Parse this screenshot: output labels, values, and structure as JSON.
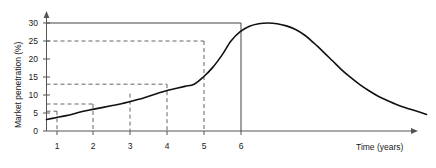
{
  "chart_data": {
    "type": "line",
    "title": "",
    "xlabel": "Time (years)",
    "ylabel": "Market penetration (%)",
    "xlim": [
      0,
      10.6
    ],
    "ylim": [
      0,
      32.5
    ],
    "grid": false,
    "legend": "none",
    "x_ticks": [
      "1",
      "2",
      "3",
      "4",
      "5",
      "6"
    ],
    "x_tick_values": [
      1,
      2,
      3,
      4,
      5,
      6
    ],
    "y_ticks": [
      "0",
      "5",
      "10",
      "15",
      "20",
      "25",
      "30"
    ],
    "y_tick_values": [
      0,
      5,
      10,
      15,
      20,
      25,
      30
    ],
    "series": [
      {
        "name": "Market penetration",
        "x": [
          0.0,
          0.25,
          0.5,
          0.75,
          1.0,
          1.25,
          1.5,
          1.75,
          2.0,
          2.25,
          2.5,
          2.75,
          3.0,
          3.25,
          3.5,
          3.75,
          4.0,
          4.25,
          4.5,
          4.75,
          5.0,
          5.25,
          5.5,
          5.75,
          6.0,
          6.25,
          6.5,
          6.75,
          7.0,
          7.25,
          7.5,
          7.75,
          8.0,
          8.25,
          8.5,
          8.75,
          9.0,
          9.25,
          9.5,
          9.75,
          10.0,
          10.3
        ],
        "values": [
          3.2,
          3.7,
          4.2,
          4.8,
          5.5,
          6.0,
          6.5,
          7.0,
          7.5,
          8.1,
          8.8,
          9.6,
          10.4,
          11.2,
          11.8,
          12.4,
          13.0,
          15.0,
          17.6,
          21.0,
          25.0,
          27.6,
          29.1,
          29.8,
          30.0,
          29.8,
          29.2,
          28.2,
          26.6,
          24.4,
          22.0,
          19.5,
          17.0,
          14.8,
          12.8,
          11.1,
          9.6,
          8.4,
          7.3,
          6.4,
          5.6,
          4.6
        ]
      }
    ],
    "annotations": [
      {
        "kind": "solid-horizontal",
        "y": 30,
        "from_x": 0,
        "to_x": 6,
        "label": "peak level 30%"
      },
      {
        "kind": "solid-vertical",
        "x": 6,
        "from_y": 0,
        "to_y": 30,
        "label": "peak time 6 years"
      },
      {
        "kind": "dashed-horizontal",
        "y": 25,
        "from_x": 0,
        "to_x": 5
      },
      {
        "kind": "dashed-vertical",
        "x": 5,
        "from_y": 0,
        "to_y": 25
      },
      {
        "kind": "dashed-horizontal",
        "y": 13,
        "from_x": 0,
        "to_x": 4
      },
      {
        "kind": "dashed-vertical",
        "x": 4,
        "from_y": 0,
        "to_y": 13
      },
      {
        "kind": "dashed-horizontal",
        "y": 7.5,
        "from_x": 0,
        "to_x": 2
      },
      {
        "kind": "dashed-vertical",
        "x": 3,
        "from_y": 0,
        "to_y": 10.4
      },
      {
        "kind": "dashed-vertical",
        "x": 2,
        "from_y": 0,
        "to_y": 7.5
      },
      {
        "kind": "dashed-horizontal",
        "y": 5.5,
        "from_x": 0,
        "to_x": 1
      },
      {
        "kind": "dashed-vertical",
        "x": 1,
        "from_y": 0,
        "to_y": 5.5
      }
    ],
    "colors": {
      "curve": "#111111",
      "axis": "#555555",
      "dashed": "#666666",
      "solid_guide": "#444444",
      "background": "#ffffff",
      "text": "#1a1a1a"
    }
  }
}
